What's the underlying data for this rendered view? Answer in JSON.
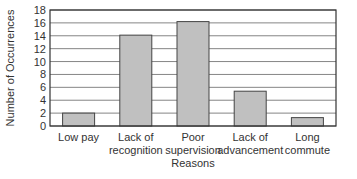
{
  "chart_data": {
    "type": "bar",
    "title": "",
    "xlabel": "Reasons",
    "ylabel": "Number of Occurrences",
    "categories": [
      "Low pay",
      "Lack of recognition",
      "Poor supervision",
      "Lack of advancement",
      "Long commute"
    ],
    "category_lines": [
      [
        "Low pay"
      ],
      [
        "Lack of",
        "recognition"
      ],
      [
        "Poor",
        "supervision"
      ],
      [
        "Lack of",
        "advancement"
      ],
      [
        "Long",
        "commute"
      ]
    ],
    "values": [
      2,
      14.1,
      16.2,
      5.4,
      1.3
    ],
    "ylim": [
      0,
      18
    ],
    "yticks": [
      0,
      2,
      4,
      6,
      8,
      10,
      12,
      14,
      16,
      18
    ],
    "grid": true,
    "legend": null,
    "colors": {
      "bar_fill": "#c0c0c0",
      "bar_stroke": "#444444",
      "grid": "#666666",
      "axis": "#333333"
    }
  }
}
